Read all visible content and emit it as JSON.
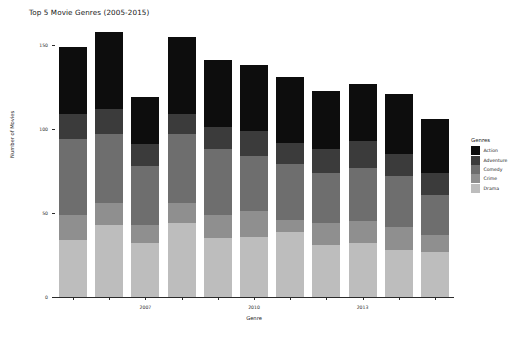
{
  "chart_data": {
    "type": "bar",
    "subtype": "stacked-bar",
    "title": "Top 5 Movie Genres (2005-2015)",
    "xlabel": "Genre",
    "ylabel": "Number of Movies",
    "categories": [
      "2005",
      "2006",
      "2007",
      "2008",
      "2009",
      "2010",
      "2011",
      "2012",
      "2013",
      "2014",
      "2015"
    ],
    "x_tick_labels": [
      "2007",
      "2010",
      "2013"
    ],
    "x_tick_categories": [
      "2007",
      "2010",
      "2013"
    ],
    "y_tick_labels": [
      "0",
      "50",
      "100",
      "150"
    ],
    "y_tick_values": [
      0,
      50,
      100,
      150
    ],
    "ylim": [
      0,
      165
    ],
    "grid": false,
    "legend_title": "Genres",
    "legend_position": "right",
    "series": [
      {
        "name": "Action",
        "color": "#0d0d0d",
        "values": [
          40,
          46,
          28,
          46,
          40,
          39,
          39,
          35,
          34,
          36,
          32
        ]
      },
      {
        "name": "Adventure",
        "color": "#3b3b3b",
        "values": [
          15,
          15,
          13,
          12,
          13,
          15,
          13,
          14,
          16,
          13,
          13
        ]
      },
      {
        "name": "Comedy",
        "color": "#6e6e6e",
        "values": [
          45,
          41,
          35,
          41,
          39,
          33,
          33,
          30,
          32,
          30,
          24
        ]
      },
      {
        "name": "Crime",
        "color": "#8f8f8f",
        "values": [
          15,
          13,
          11,
          12,
          14,
          15,
          7,
          13,
          13,
          14,
          10
        ]
      },
      {
        "name": "Drama",
        "color": "#bdbdbd",
        "values": [
          34,
          43,
          32,
          44,
          35,
          36,
          39,
          31,
          32,
          28,
          27
        ]
      }
    ],
    "totals": [
      149,
      158,
      119,
      155,
      141,
      138,
      131,
      123,
      127,
      121,
      106
    ]
  },
  "figure": {
    "background": "#ffffff",
    "axis_color": "#2b2b2b"
  }
}
